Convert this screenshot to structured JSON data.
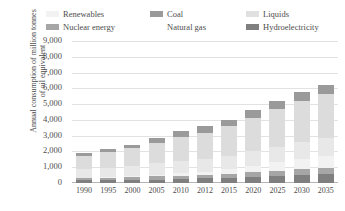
{
  "chart_data": {
    "type": "bar",
    "title": "",
    "subtitle": "",
    "xlabel": "",
    "ylabel": "Annual consumption of million tonnes of oil equivalent",
    "ylim": [
      0,
      9000
    ],
    "ytick_values": [
      9000,
      8000,
      7000,
      6000,
      5000,
      4000,
      3000,
      2000,
      1000,
      0
    ],
    "ytick_labels": [
      "9,000",
      "8,000",
      "7,000",
      "6,000",
      "5,000",
      "4,000",
      "3,000",
      "2,000",
      "1,000",
      "0"
    ],
    "grid": true,
    "stacked": true,
    "legend_position": "top",
    "categories": [
      "1990",
      "1995",
      "2000",
      "2005",
      "2010",
      "2012",
      "2015",
      "2020",
      "2025",
      "2030",
      "2035"
    ],
    "series": [
      {
        "name": "Hydroelectricity",
        "color": "#7f7f7f",
        "values": [
          160,
          180,
          200,
          220,
          260,
          300,
          340,
          400,
          450,
          500,
          540
        ]
      },
      {
        "name": "Nuclear energy",
        "color": "#a6a6a6",
        "values": [
          140,
          160,
          180,
          200,
          200,
          210,
          240,
          290,
          340,
          390,
          430
        ]
      },
      {
        "name": "Renewables",
        "color": "#f2f2f2",
        "values": [
          30,
          40,
          60,
          90,
          150,
          200,
          280,
          400,
          520,
          640,
          760
        ]
      },
      {
        "name": "Liquids",
        "color": "#e8e8e8",
        "values": [
          540,
          600,
          660,
          740,
          780,
          810,
          860,
          930,
          1000,
          1060,
          1110
        ]
      },
      {
        "name": "Natural gas",
        "color": "#dcdcdc",
        "values": [
          860,
          960,
          1100,
          1320,
          1560,
          1680,
          1870,
          2130,
          2380,
          2620,
          2830
        ]
      },
      {
        "name": "Coal",
        "color": "#9a9a9a",
        "values": [
          170,
          190,
          210,
          280,
          350,
          390,
          420,
          460,
          500,
          530,
          560
        ]
      }
    ],
    "totals": [
      1900,
      2130,
      2410,
      2850,
      3300,
      3590,
      4010,
      4610,
      5190,
      5740,
      6230
    ]
  },
  "legend": {
    "rows": [
      [
        {
          "label": "Renewables",
          "color": "#f2f2f2",
          "icon": "legend-swatch-renewables"
        },
        {
          "label": "Coal",
          "color": "#9a9a9a",
          "icon": "legend-swatch-coal"
        },
        {
          "label": "Liquids",
          "color": "#e0e0e0",
          "icon": "legend-swatch-liquids"
        }
      ],
      [
        {
          "label": "Nuclear energy",
          "color": "#a6a6a6",
          "icon": "legend-swatch-nuclear-energy"
        },
        {
          "label": "Natural gas",
          "color": "#ffffff",
          "icon": "legend-swatch-natural-gas"
        },
        {
          "label": "Hydroelectricity",
          "color": "#7f7f7f",
          "icon": "legend-swatch-hydroelectricity"
        }
      ]
    ]
  },
  "axis": {
    "y_title": "Annual consumption of million tonnes of oil equivalent"
  }
}
